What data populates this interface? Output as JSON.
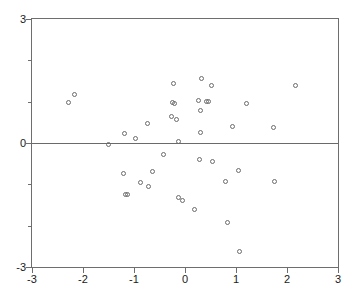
{
  "chart_data": {
    "type": "scatter",
    "title": "",
    "subtitle": "",
    "xlabel": "",
    "ylabel": "",
    "xlim": [
      -3,
      3
    ],
    "ylim": [
      -3,
      3
    ],
    "grid": false,
    "legend": null,
    "legend_position": "none",
    "annotations": [
      {
        "type": "reference-line",
        "axis": "y",
        "value": 0
      }
    ],
    "xticks": [
      -3,
      -2,
      -1,
      0,
      1,
      2,
      3
    ],
    "xtick_labels": [
      "-3",
      "-2",
      "-1",
      "0",
      "1",
      "2",
      "3"
    ],
    "yticks": [
      -3,
      0,
      3
    ],
    "ytick_labels": [
      "-3",
      "0",
      "3"
    ],
    "yticks_minor": [
      -2,
      -1,
      1,
      2
    ],
    "marker_style": "open-circle",
    "marker_color": "#6b6b6b",
    "axis_color": "#6e6e6e",
    "background_color": "#ffffff",
    "series": [
      {
        "name": "observations",
        "points": [
          [
            -2.16,
            1.18
          ],
          [
            -2.28,
            0.97
          ],
          [
            -1.5,
            -0.03
          ],
          [
            -1.19,
            0.23
          ],
          [
            -1.21,
            -0.74
          ],
          [
            -1.16,
            -1.24
          ],
          [
            -1.13,
            -1.25
          ],
          [
            -0.97,
            0.12
          ],
          [
            -0.88,
            -0.95
          ],
          [
            -0.74,
            0.46
          ],
          [
            -0.72,
            -1.05
          ],
          [
            -0.64,
            -0.7
          ],
          [
            -0.42,
            -0.27
          ],
          [
            -0.27,
            0.63
          ],
          [
            -0.22,
            1.43
          ],
          [
            -0.24,
            0.98
          ],
          [
            -0.21,
            0.96
          ],
          [
            -0.17,
            0.57
          ],
          [
            -0.12,
            0.03
          ],
          [
            -0.13,
            -1.32
          ],
          [
            -0.04,
            -1.4
          ],
          [
            0.18,
            -1.62
          ],
          [
            0.26,
            1.04
          ],
          [
            0.3,
            0.78
          ],
          [
            0.31,
            0.26
          ],
          [
            0.32,
            1.55
          ],
          [
            0.29,
            -0.39
          ],
          [
            0.43,
            1.0
          ],
          [
            0.46,
            1.01
          ],
          [
            0.52,
            1.4
          ],
          [
            0.54,
            -0.45
          ],
          [
            0.8,
            -0.94
          ],
          [
            0.83,
            -1.93
          ],
          [
            0.93,
            0.39
          ],
          [
            1.05,
            -0.67
          ],
          [
            1.07,
            -2.63
          ],
          [
            1.21,
            0.96
          ],
          [
            1.73,
            0.37
          ],
          [
            1.75,
            -0.93
          ],
          [
            2.17,
            1.39
          ]
        ]
      }
    ]
  },
  "axes": {
    "x_axis_name": "x-axis",
    "y_axis_name": "y-axis"
  }
}
